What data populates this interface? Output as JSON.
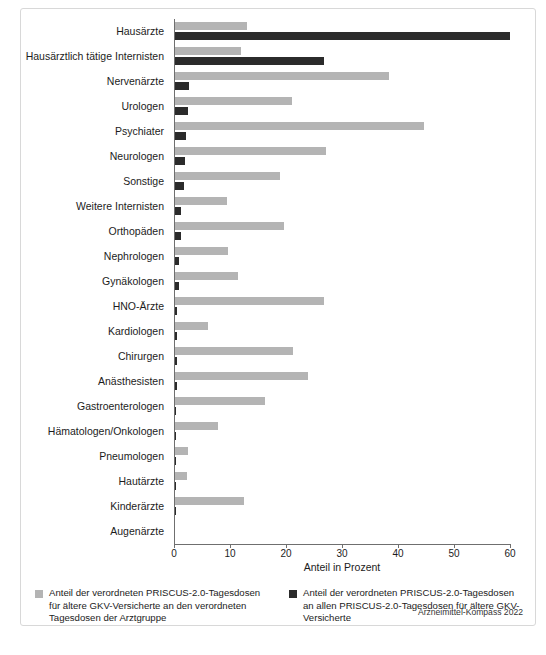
{
  "chart_data": {
    "type": "bar",
    "orientation": "horizontal",
    "title": "",
    "xlabel": "Anteil in Prozent",
    "ylabel": "",
    "xlim": [
      0,
      60
    ],
    "xticks": [
      0,
      10,
      20,
      30,
      40,
      50,
      60
    ],
    "grid": false,
    "legend_position": "bottom",
    "categories": [
      "Hausärzte",
      "Hausärztlich tätige Internisten",
      "Nervenärzte",
      "Urologen",
      "Psychiater",
      "Neurologen",
      "Sonstige",
      "Weitere Internisten",
      "Orthopäden",
      "Nephrologen",
      "Gynäkologen",
      "HNO-Ärzte",
      "Kardiologen",
      "Chirurgen",
      "Anästhesisten",
      "Gastroenterologen",
      "Hämatologen/Onkologen",
      "Pneumologen",
      "Hautärzte",
      "Kinderärzte",
      "Augenärzte"
    ],
    "series": [
      {
        "name": "Anteil der verordneten PRISCUS-2.0-Tagesdosen für ältere GKV-Versicherte an den verordneten Tagesdosen der Arztgruppe",
        "color": "#b4b4b4",
        "values": [
          12.9,
          11.8,
          38.2,
          20.9,
          44.5,
          26.9,
          18.8,
          9.3,
          19.4,
          9.5,
          11.2,
          26.6,
          5.9,
          21.0,
          23.7,
          16.0,
          7.7,
          2.3,
          2.2,
          12.3,
          0.0
        ]
      },
      {
        "name": "Anteil der verordneten PRISCUS-2.0-Tagesdosen an allen PRISCUS-2.0-Tagesdosen für ältere GKV-Versicherte",
        "color": "#2b2b2b",
        "values": [
          59.8,
          26.6,
          2.5,
          2.4,
          1.9,
          1.7,
          1.6,
          1.1,
          1.0,
          0.8,
          0.8,
          0.4,
          0.3,
          0.3,
          0.3,
          0.25,
          0.2,
          0.15,
          0.1,
          0.05,
          0.0
        ]
      }
    ]
  },
  "axis": {
    "x_title": "Anteil in Prozent",
    "tick_labels": [
      "0",
      "10",
      "20",
      "30",
      "40",
      "50",
      "60"
    ]
  },
  "legend": {
    "items": [
      {
        "color": "#b4b4b4",
        "label": "Anteil der verordneten PRISCUS-2.0-Tagesdosen für ältere GKV-Versicherte an den verordneten Tagesdosen der Arztgruppe"
      },
      {
        "color": "#2b2b2b",
        "label": "Anteil der verordneten PRISCUS-2.0-Tagesdosen an allen PRISCUS-2.0-Tagesdosen für ältere GKV-Versicherte"
      }
    ]
  },
  "source": "Arzneimittel-Kompass 2022"
}
